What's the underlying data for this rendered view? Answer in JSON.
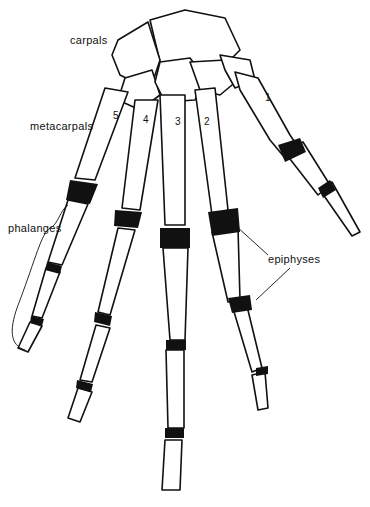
{
  "figure": {
    "labels": {
      "carpals": "carpals",
      "metacarpals": "metacarpals",
      "phalanges": "phalanges",
      "epiphyses": "epiphyses"
    },
    "metacarpal_numbers": [
      "1",
      "2",
      "3",
      "4",
      "5"
    ],
    "colors": {
      "ink": "#111111",
      "background": "#ffffff"
    }
  }
}
